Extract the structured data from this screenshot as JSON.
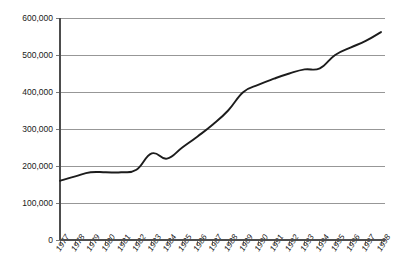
{
  "chart_data": {
    "type": "line",
    "title": "",
    "subtitle": "",
    "xlabel": "",
    "ylabel": "",
    "grid": "horizontal",
    "legend": "none",
    "xlim": [
      1977,
      1998
    ],
    "ylim": [
      0,
      600000
    ],
    "ytick_values": [
      0,
      100000,
      200000,
      300000,
      400000,
      500000,
      600000
    ],
    "ytick_labels": [
      "0",
      "100,000",
      "200,000",
      "300,000",
      "400,000",
      "500,000",
      "600,000"
    ],
    "categories": [
      "1977",
      "1978",
      "1979",
      "1980",
      "1981",
      "1982",
      "1983",
      "1984",
      "1985",
      "1986",
      "1987",
      "1988",
      "1989",
      "1990",
      "1991",
      "1992",
      "1993",
      "1994",
      "1995",
      "1996",
      "1997",
      "1998"
    ],
    "x": [
      1977,
      1978,
      1979,
      1980,
      1981,
      1982,
      1983,
      1984,
      1985,
      1986,
      1987,
      1988,
      1989,
      1990,
      1991,
      1992,
      1993,
      1994,
      1995,
      1996,
      1997,
      1998
    ],
    "values": [
      160000,
      172000,
      183000,
      183000,
      183000,
      190000,
      234000,
      220000,
      250000,
      280000,
      312000,
      350000,
      400000,
      420000,
      436000,
      450000,
      461000,
      464000,
      500000,
      520000,
      538000,
      562000
    ],
    "series": [
      {
        "name": "series-1",
        "color": "#1c1c1c",
        "values": [
          160000,
          172000,
          183000,
          183000,
          183000,
          190000,
          234000,
          220000,
          250000,
          280000,
          312000,
          350000,
          400000,
          420000,
          436000,
          450000,
          461000,
          464000,
          500000,
          520000,
          538000,
          562000
        ]
      }
    ],
    "colors": {
      "line": "#1c1c1c",
      "grid": "#8c8c8c",
      "axis": "#4d4d4d",
      "text": "#1a1a1a",
      "background": "#ffffff"
    }
  }
}
